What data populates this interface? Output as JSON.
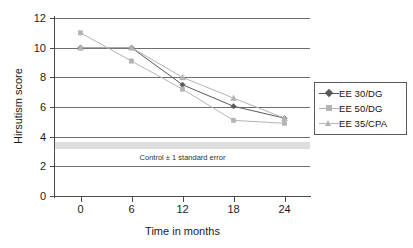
{
  "chart_data": {
    "type": "line",
    "title": "",
    "xlabel": "Time in months",
    "ylabel": "Hirsutism score",
    "x": [
      0,
      6,
      12,
      18,
      24
    ],
    "xticklabels": [
      "0",
      "6",
      "12",
      "18",
      "24"
    ],
    "yticklabels": [
      "0",
      "2",
      "4",
      "6",
      "8",
      "10",
      "12"
    ],
    "yticks": [
      0,
      2,
      4,
      6,
      8,
      10,
      12
    ],
    "xlim": [
      -3,
      27
    ],
    "ylim": [
      0,
      12
    ],
    "grid": "horizontal",
    "legend_position": "right",
    "series": [
      {
        "name": "EE 30/DG",
        "marker": "diamond",
        "color": "#5a5a5a",
        "values": [
          10.0,
          10.0,
          7.5,
          6.05,
          5.25
        ]
      },
      {
        "name": "EE 50/DG",
        "marker": "square",
        "color": "#b4b4b4",
        "values": [
          11.0,
          9.1,
          7.2,
          5.1,
          4.9
        ]
      },
      {
        "name": "EE 35/CPA",
        "marker": "triangle",
        "color": "#b4b4b4",
        "values": [
          10.0,
          10.0,
          8.0,
          6.6,
          5.25
        ]
      }
    ],
    "annotations": [
      {
        "name": "control-band",
        "text": "Control ± 1 standard error",
        "y_center": 3.42,
        "y_low": 3.2,
        "y_high": 3.65,
        "color": "#dedede"
      }
    ]
  },
  "legend": {
    "items": [
      {
        "label": "EE 30/DG"
      },
      {
        "label": "EE 50/DG"
      },
      {
        "label": "EE 35/CPA"
      }
    ]
  },
  "axes": {
    "x_title": "Time in months",
    "y_title": "Hirsutism score"
  },
  "colors": {
    "series_dark": "#5a5a5a",
    "series_light": "#b4b4b4",
    "gridline": "#6e6e6e",
    "axis": "#4a4a4a",
    "band": "#dedede",
    "text": "#1a1a1a"
  }
}
